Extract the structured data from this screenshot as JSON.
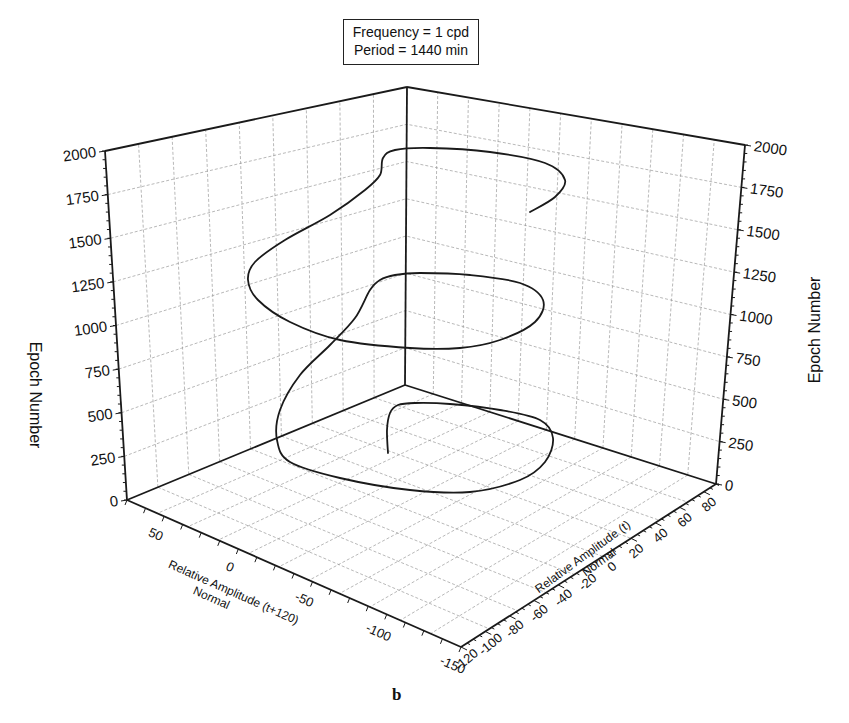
{
  "info_box": {
    "line1": "Frequency = 1 cpd",
    "line2": "Period = 1440 min"
  },
  "figure_label": "b",
  "chart_data": {
    "type": "line",
    "subtype": "3d-line",
    "annotations": [
      "Frequency = 1 cpd",
      "Period = 1440 min"
    ],
    "figure_panel": "b",
    "zlabel": "Epoch Number",
    "zlabel_right": "Epoch Number",
    "xlabel": "Relative Amplitude (t+120)\nNormal",
    "ylabel": "Relative Amplitude (t)\nNormal",
    "z_ticks": [
      0,
      250,
      500,
      750,
      1000,
      1250,
      1500,
      1750,
      2000
    ],
    "zlim": [
      0,
      2000
    ],
    "x_ticks": [
      50,
      0,
      -50,
      -100,
      -150
    ],
    "xlim": [
      75,
      -150
    ],
    "y_ticks": [
      -120,
      -100,
      -80,
      -60,
      -40,
      -20,
      0,
      20,
      40,
      60,
      80
    ],
    "ylim": [
      -120,
      90
    ],
    "grid": true,
    "legend": null,
    "series": [
      {
        "name": "trajectory",
        "description": "Spiral trajectory rising with epoch number, about 1.5 loops over 0-2000 epochs",
        "points_screen": [
          [
            388,
            453
          ],
          [
            387,
            430
          ],
          [
            390,
            413
          ],
          [
            398,
            405
          ],
          [
            415,
            403
          ],
          [
            450,
            404
          ],
          [
            500,
            410
          ],
          [
            540,
            420
          ],
          [
            553,
            438
          ],
          [
            545,
            462
          ],
          [
            520,
            480
          ],
          [
            470,
            492
          ],
          [
            410,
            490
          ],
          [
            340,
            478
          ],
          [
            290,
            462
          ],
          [
            277,
            440
          ],
          [
            280,
            410
          ],
          [
            300,
            375
          ],
          [
            330,
            345
          ],
          [
            355,
            318
          ],
          [
            370,
            290
          ],
          [
            380,
            280
          ],
          [
            395,
            275
          ],
          [
            420,
            273
          ],
          [
            470,
            275
          ],
          [
            520,
            283
          ],
          [
            543,
            300
          ],
          [
            535,
            322
          ],
          [
            500,
            340
          ],
          [
            460,
            348
          ],
          [
            410,
            348
          ],
          [
            340,
            340
          ],
          [
            290,
            322
          ],
          [
            258,
            300
          ],
          [
            248,
            280
          ],
          [
            255,
            262
          ],
          [
            285,
            240
          ],
          [
            330,
            215
          ],
          [
            365,
            190
          ],
          [
            380,
            175
          ],
          [
            383,
            158
          ],
          [
            395,
            150
          ],
          [
            430,
            148
          ],
          [
            490,
            152
          ],
          [
            545,
            163
          ],
          [
            565,
            180
          ],
          [
            555,
            197
          ],
          [
            530,
            212
          ]
        ]
      }
    ]
  }
}
